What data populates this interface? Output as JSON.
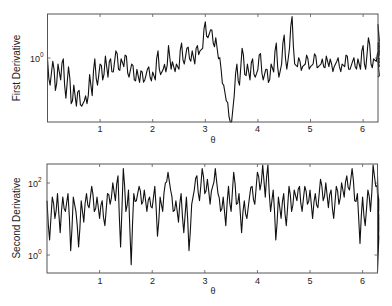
{
  "chart_data": [
    {
      "type": "line",
      "title": "",
      "xlabel": "θ",
      "ylabel": "First Derivative",
      "yscale": "log",
      "xlim": [
        0,
        6.283
      ],
      "ylim_log10": [
        -1.3,
        0.75
      ],
      "x_ticks": [
        "1",
        "2",
        "3",
        "4",
        "5",
        "6"
      ],
      "y_ticks": [
        {
          "base": "10",
          "exp": "0"
        }
      ],
      "grid": false,
      "legend": null,
      "series": [
        {
          "name": "First Derivative",
          "x_step": 0.05,
          "log10_values": [
            -0.1,
            -0.6,
            -0.15,
            -0.7,
            -0.2,
            -0.5,
            -0.1,
            -0.85,
            -0.25,
            -0.95,
            -0.6,
            -1.0,
            -0.7,
            -1.0,
            -0.9,
            -0.95,
            -0.4,
            -0.8,
            -0.1,
            -0.6,
            -0.2,
            -0.5,
            -0.05,
            -0.45,
            -0.1,
            -0.35,
            0.05,
            -0.3,
            -0.1,
            -0.25,
            -0.05,
            -0.45,
            -0.2,
            -0.5,
            -0.3,
            -0.55,
            -0.35,
            -0.5,
            -0.3,
            -0.45,
            -0.35,
            -0.5,
            0.05,
            -0.4,
            -0.3,
            -0.35,
            0.15,
            -0.3,
            -0.25,
            -0.2,
            -0.3,
            0.2,
            -0.2,
            0.1,
            -0.1,
            0.05,
            -0.2,
            0.15,
            0.05,
            0.1,
            0.6,
            0.3,
            0.45,
            0.2,
            0.3,
            -0.1,
            -0.3,
            -0.6,
            -0.9,
            -1.2,
            -1.3,
            -0.8,
            -0.2,
            -0.6,
            0.1,
            -0.4,
            -0.2,
            -0.5,
            -0.1,
            -0.45,
            -0.3,
            0.0,
            -0.5,
            -0.3,
            -0.55,
            -0.2,
            -0.35,
            0.2,
            -0.45,
            -0.2,
            0.35,
            -0.3,
            0.1,
            0.7,
            -0.2,
            -0.25,
            -0.15,
            -0.25,
            -0.2,
            -0.1,
            -0.25,
            -0.2,
            -0.05,
            -0.25,
            -0.2,
            -0.25,
            -0.05,
            -0.25,
            -0.2,
            -0.25,
            -0.15,
            -0.25,
            -0.2,
            -0.25,
            -0.05,
            -0.3,
            -0.15,
            -0.25,
            -0.1,
            -0.3,
            0.15,
            -0.3,
            0.3,
            -0.2,
            -0.1,
            -0.15,
            -0.05,
            0.55,
            -0.05,
            -0.1,
            -0.15,
            -0.05,
            0.0,
            -0.1,
            0.15,
            0.1,
            0.2,
            0.05,
            0.1,
            0.2,
            -0.1,
            -0.15,
            -0.45
          ]
        }
      ]
    },
    {
      "type": "line",
      "title": "",
      "xlabel": "θ",
      "ylabel": "Second Derivative",
      "yscale": "log",
      "xlim": [
        0,
        6.283
      ],
      "ylim_log10": [
        -0.53,
        2.53
      ],
      "x_ticks": [
        "1",
        "2",
        "3",
        "4",
        "5",
        "6"
      ],
      "y_ticks": [
        {
          "base": "10",
          "exp": "0"
        },
        {
          "base": "10",
          "exp": "2"
        }
      ],
      "grid": false,
      "legend": null,
      "series": [
        {
          "name": "Second Derivative",
          "x_step": 0.05,
          "log10_values": [
            1.5,
            0.4,
            1.6,
            1.0,
            1.7,
            0.6,
            1.6,
            1.2,
            1.7,
            0.1,
            1.6,
            1.2,
            0.2,
            1.5,
            0.9,
            1.7,
            1.3,
            1.9,
            1.2,
            1.6,
            1.0,
            1.5,
            0.8,
            1.7,
            1.4,
            2.0,
            1.5,
            2.2,
            0.2,
            2.4,
            1.2,
            1.8,
            -0.3,
            1.7,
            1.5,
            1.9,
            1.4,
            1.8,
            1.2,
            1.6,
            1.3,
            1.9,
            0.5,
            1.6,
            1.2,
            2.0,
            2.3,
            1.8,
            1.2,
            1.5,
            0.9,
            1.7,
            0.6,
            1.6,
            0.1,
            1.4,
            1.8,
            2.2,
            1.5,
            2.4,
            1.7,
            2.1,
            1.4,
            1.9,
            2.4,
            1.7,
            1.2,
            1.6,
            0.8,
            1.9,
            1.2,
            2.3,
            1.4,
            1.7,
            0.6,
            1.5,
            1.0,
            1.6,
            1.9,
            1.4,
            2.3,
            1.8,
            2.5,
            1.6,
            2.5,
            1.2,
            1.8,
            0.4,
            1.6,
            1.0,
            1.7,
            0.8,
            1.9,
            1.2,
            1.8,
            1.5,
            1.9,
            1.2,
            1.9,
            1.4,
            1.8,
            1.0,
            1.7,
            1.3,
            2.1,
            1.5,
            2.0,
            1.3,
            1.8,
            1.0,
            1.9,
            1.4,
            2.0,
            1.6,
            2.2,
            1.8,
            2.4,
            1.5,
            1.7,
            0.3,
            1.6,
            0.8,
            1.8,
            1.2,
            2.5,
            1.9,
            1.7,
            1.4,
            0.5,
            1.9,
            1.2,
            1.8,
            1.0,
            1.7,
            0.3,
            1.6,
            1.3,
            1.7,
            0.1,
            1.6,
            1.2,
            -0.5,
            2.2,
            -0.5
          ]
        }
      ]
    }
  ],
  "panels": {
    "top": {
      "ylabel": "First Derivative",
      "xlabel": "θ",
      "ytick_base": "10",
      "ytick_exp": "0",
      "xticks": [
        "1",
        "2",
        "3",
        "4",
        "5",
        "6"
      ]
    },
    "bottom": {
      "ylabel": "Second Derivative",
      "xlabel": "θ",
      "ytick_hi_base": "10",
      "ytick_hi_exp": "2",
      "ytick_lo_base": "10",
      "ytick_lo_exp": "0",
      "xticks": [
        "1",
        "2",
        "3",
        "4",
        "5",
        "6"
      ]
    }
  }
}
